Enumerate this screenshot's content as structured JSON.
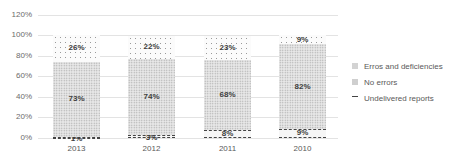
{
  "chart_data": {
    "type": "bar",
    "stacked": true,
    "title": "",
    "xlabel": "",
    "ylabel": "",
    "ylim": [
      0,
      120
    ],
    "yticks": [
      "0%",
      "20%",
      "40%",
      "60%",
      "80%",
      "100%",
      "120%"
    ],
    "categories": [
      "2013",
      "2012",
      "2011",
      "2010"
    ],
    "series": [
      {
        "name": "Undelivered reports",
        "values": [
          1,
          3,
          8,
          9
        ],
        "labels": [
          "1%",
          "3%",
          "8%",
          "9%"
        ]
      },
      {
        "name": "No errors",
        "values": [
          73,
          74,
          68,
          82
        ],
        "labels": [
          "73%",
          "74%",
          "68%",
          "82%"
        ]
      },
      {
        "name": "Erros and deficiencies",
        "values": [
          26,
          22,
          23,
          9
        ],
        "labels": [
          "26%",
          "22%",
          "23%",
          "9%"
        ]
      }
    ],
    "legend": [
      "Erros and deficiencies",
      "No errors",
      "Undelivered reports"
    ],
    "legend_position": "right",
    "grid": true
  }
}
